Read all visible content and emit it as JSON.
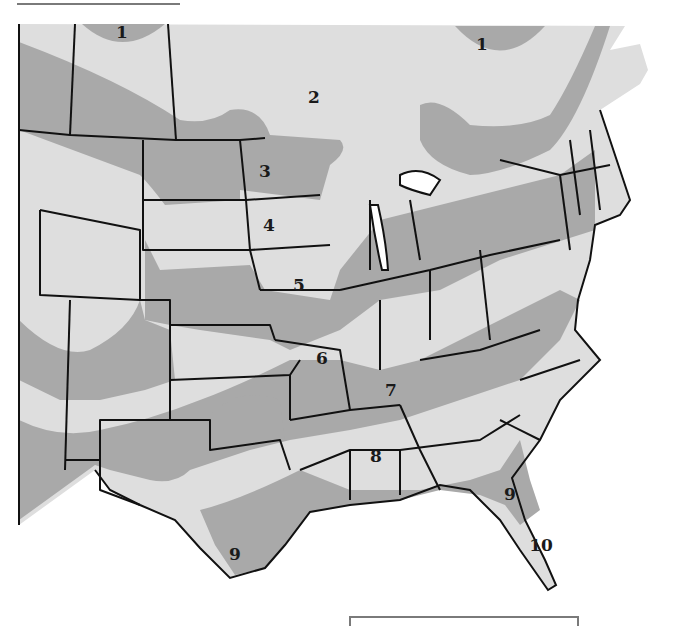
{
  "map": {
    "type": "hardiness-zone-map",
    "colors": {
      "light_zone": "#dedede",
      "dark_zone": "#a9a9a9",
      "border": "#111111",
      "background": "#ffffff",
      "frame_rule": "#7a7a7a"
    },
    "zone_labels": [
      {
        "text": "1",
        "x": 122,
        "y": 38
      },
      {
        "text": "1",
        "x": 482,
        "y": 50
      },
      {
        "text": "2",
        "x": 314,
        "y": 103
      },
      {
        "text": "3",
        "x": 265,
        "y": 177
      },
      {
        "text": "4",
        "x": 269,
        "y": 231
      },
      {
        "text": "5",
        "x": 299,
        "y": 291
      },
      {
        "text": "6",
        "x": 322,
        "y": 364
      },
      {
        "text": "7",
        "x": 391,
        "y": 396
      },
      {
        "text": "8",
        "x": 376,
        "y": 462
      },
      {
        "text": "9",
        "x": 510,
        "y": 500
      },
      {
        "text": "9",
        "x": 235,
        "y": 560
      },
      {
        "text": "10",
        "x": 541,
        "y": 551
      }
    ]
  }
}
